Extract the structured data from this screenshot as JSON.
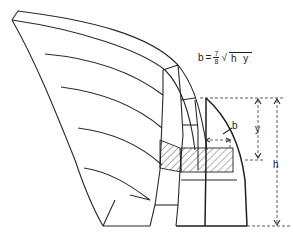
{
  "formula": {
    "lhs": "b",
    "eq": "=",
    "numerator": "7",
    "denominator": "8",
    "radical": "√",
    "radicand": "h y"
  },
  "labels": {
    "b": "b",
    "y": "y",
    "h": "h"
  }
}
